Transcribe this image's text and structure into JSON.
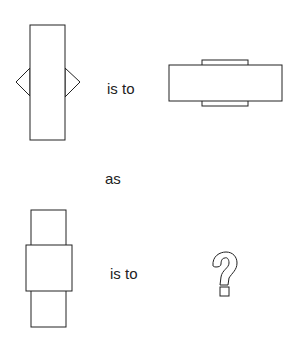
{
  "puzzle": {
    "type": "visual analogy",
    "row1_relation": "is to",
    "connector": "as",
    "row2_relation": "is to",
    "answer_placeholder": "?"
  },
  "figures": {
    "a": "tall rectangle with triangles on left and right sides",
    "b": "wide rectangle with small tabs on top and bottom",
    "c": "tall narrow rectangle overlaid by a wider square in the middle",
    "d": "unknown (question mark)"
  },
  "colors": {
    "stroke": "#222222",
    "background": "#ffffff"
  }
}
